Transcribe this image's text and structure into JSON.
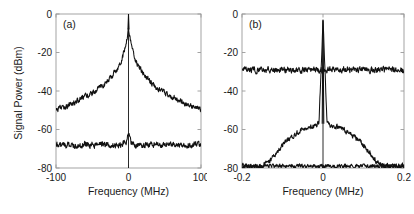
{
  "figure": {
    "ylabel": "Signal Power (dBm)",
    "xlabel": "Frequency (MHz)",
    "line_color": "#111111",
    "axis_color": "#9a9a9a",
    "text_color": "#1a1a1a",
    "background": "#ffffff"
  },
  "chart_data": [
    {
      "type": "line",
      "panel_label": "(a)",
      "title": "",
      "xlabel": "Frequency (MHz)",
      "ylabel": "Signal Power (dBm)",
      "xlim": [
        -100,
        100
      ],
      "ylim": [
        -80,
        0
      ],
      "xticks": [
        -100,
        0,
        100
      ],
      "xticklabels": [
        "-100",
        "0",
        "100"
      ],
      "yticks": [
        0,
        -20,
        -40,
        -60,
        -80
      ],
      "yticklabels": [
        "0",
        "-20",
        "-40",
        "-60",
        "-80"
      ],
      "grid": false,
      "legend": "none",
      "series": [
        {
          "name": "free-running-beat-note",
          "description": "Broad Lorentzian pedestal with narrow carrier spike at 0 MHz",
          "peak_dbm": -8,
          "carrier_spike_dbm": 0,
          "carrier_spike_width_mhz": 1.2,
          "baseline_edges_dbm": -50,
          "noise_amplitude_db": 2.2,
          "x": [
            -100,
            -90,
            -80,
            -70,
            -60,
            -50,
            -40,
            -30,
            -20,
            -12,
            -8,
            -5,
            -3,
            -2,
            -1,
            0,
            1,
            2,
            3,
            5,
            8,
            12,
            20,
            30,
            40,
            50,
            60,
            70,
            80,
            90,
            100
          ],
          "values": [
            -50,
            -48.5,
            -47,
            -45,
            -43,
            -41,
            -38.5,
            -35.5,
            -31,
            -26,
            -22,
            -18,
            -14,
            -12,
            -10,
            -8,
            -10,
            -12,
            -14,
            -18,
            -22,
            -26,
            -31,
            -35.5,
            -38.5,
            -41,
            -43,
            -45,
            -47,
            -48.5,
            -50
          ]
        },
        {
          "name": "detector-noise-floor",
          "description": "Flat noise floor with small residual bump at 0 MHz",
          "level_dbm": -68,
          "noise_amplitude_db": 2.5,
          "center_bump_dbm": -62,
          "x": [
            -100,
            -60,
            -30,
            -10,
            -4,
            -2,
            0,
            2,
            4,
            10,
            30,
            60,
            100
          ],
          "values": [
            -68,
            -68,
            -68,
            -68,
            -67,
            -65,
            -62,
            -65,
            -67,
            -68,
            -68,
            -68,
            -68
          ]
        }
      ]
    },
    {
      "type": "line",
      "panel_label": "(b)",
      "title": "",
      "xlabel": "Frequency (MHz)",
      "ylabel": "Signal Power (dBm)",
      "xlim": [
        -0.2,
        0.2
      ],
      "ylim": [
        -80,
        0
      ],
      "xticks": [
        -0.2,
        0,
        0.2
      ],
      "xticklabels": [
        "-0.2",
        "0",
        "0.2"
      ],
      "yticks": [
        0,
        -20,
        -40,
        -60,
        -80
      ],
      "yticklabels": [
        "0",
        "-20",
        "-40",
        "-60",
        "-80"
      ],
      "grid": false,
      "legend": "none",
      "series": [
        {
          "name": "upper-flat-trace",
          "description": "Flat broadband trace near -29 dBm across full span",
          "level_dbm": -29,
          "noise_amplitude_db": 2.5,
          "x": [
            -0.2,
            -0.1,
            0,
            0.1,
            0.2
          ],
          "values": [
            -29,
            -29,
            -29,
            -29,
            -29
          ]
        },
        {
          "name": "locked-beat-note",
          "description": "Narrow carrier spike at 0 MHz on servo-bump pedestal",
          "carrier_spike_dbm": -3,
          "carrier_spike_width_mhz": 0.004,
          "pedestal_peak_dbm": -57,
          "pedestal_half_width_mhz": 0.1,
          "floor_dbm": -79,
          "noise_amplitude_db": 2.0,
          "x": [
            -0.2,
            -0.15,
            -0.13,
            -0.11,
            -0.1,
            -0.08,
            -0.06,
            -0.04,
            -0.02,
            -0.01,
            0,
            0.01,
            0.02,
            0.04,
            0.06,
            0.08,
            0.1,
            0.11,
            0.13,
            0.15,
            0.2
          ],
          "values": [
            -79,
            -79,
            -76,
            -71,
            -68,
            -64,
            -61,
            -59,
            -58,
            -57,
            -3,
            -57,
            -58,
            -59,
            -61,
            -64,
            -68,
            -71,
            -76,
            -79,
            -79
          ]
        },
        {
          "name": "lower-noise-floor",
          "description": "Flat detector noise floor near -79 dBm",
          "level_dbm": -79,
          "noise_amplitude_db": 1.6,
          "x": [
            -0.2,
            -0.1,
            0,
            0.1,
            0.2
          ],
          "values": [
            -79,
            -79,
            -79,
            -79,
            -79
          ]
        }
      ]
    }
  ]
}
